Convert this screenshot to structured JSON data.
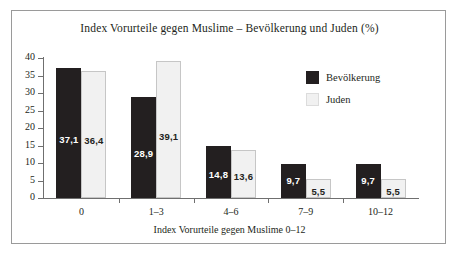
{
  "chart_data": {
    "type": "bar",
    "title": "Index Vorurteile gegen Muslime – Bevölkerung und Juden (%)",
    "xlabel": "Index Vorurteile gegen Muslime 0–12",
    "ylabel": "",
    "ylim": [
      0,
      40
    ],
    "yticks": [
      0,
      5,
      10,
      15,
      20,
      25,
      30,
      35,
      40
    ],
    "ytick_labels": [
      "0",
      "5",
      "10",
      "15",
      "20",
      "25",
      "30",
      "35",
      "40"
    ],
    "grid": false,
    "legend_position": "upper-right-inside",
    "categories": [
      "0",
      "1–3",
      "4–6",
      "7–9",
      "10–12"
    ],
    "series": [
      {
        "name": "Bevölkerung",
        "color": "#231f20",
        "values": [
          37.1,
          28.9,
          14.8,
          9.7,
          9.7
        ],
        "value_labels": [
          "37,1",
          "28,9",
          "14,8",
          "9,7",
          "9,7"
        ]
      },
      {
        "name": "Juden",
        "color": "#f1f1f1",
        "values": [
          36.4,
          39.1,
          13.6,
          5.5,
          5.5
        ],
        "value_labels": [
          "36,4",
          "39,1",
          "13,6",
          "5,5",
          "5,5"
        ]
      }
    ]
  },
  "legend": {
    "items": [
      {
        "label": "Bevölkerung",
        "swatch": "dark"
      },
      {
        "label": "Juden",
        "swatch": "light"
      }
    ]
  }
}
